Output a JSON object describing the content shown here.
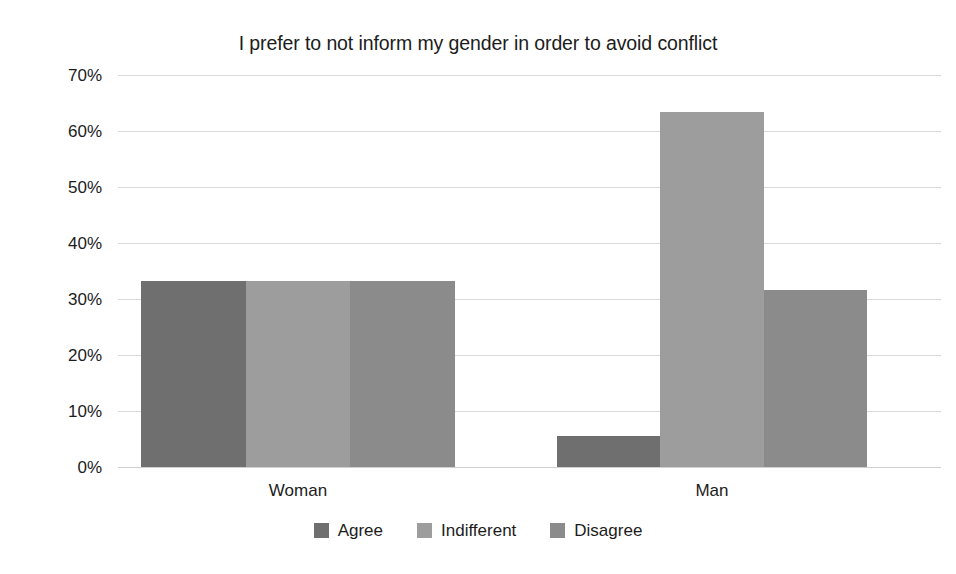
{
  "chart_data": {
    "type": "bar",
    "title": "I prefer to not inform my gender in order to avoid conflict",
    "xlabel": "",
    "ylabel": "",
    "categories": [
      "Woman",
      "Man"
    ],
    "series": [
      {
        "name": "Agree",
        "values": [
          33.3,
          5.5
        ],
        "color": "#6f6f6f"
      },
      {
        "name": "Indifferent",
        "values": [
          33.3,
          63.4
        ],
        "color": "#9d9d9d"
      },
      {
        "name": "Disagree",
        "values": [
          33.3,
          31.6
        ],
        "color": "#8b8b8b"
      }
    ],
    "ylim": [
      0,
      70
    ],
    "ytick_values": [
      70,
      60,
      50,
      40,
      30,
      20,
      10,
      0
    ],
    "ytick_labels": [
      "70%",
      "60%",
      "50%",
      "40%",
      "30%",
      "20%",
      "10%",
      "0%"
    ],
    "grid": true,
    "legend_position": "bottom",
    "bar_gap": "none",
    "value_format": "percent"
  },
  "axis": {
    "y_labels": [
      "70%",
      "60%",
      "50%",
      "40%",
      "30%",
      "20%",
      "10%",
      "0%"
    ],
    "x_labels": [
      "Woman",
      "Man"
    ]
  },
  "legend": {
    "items": [
      {
        "label": "Agree",
        "color": "#6f6f6f"
      },
      {
        "label": "Indifferent",
        "color": "#9d9d9d"
      },
      {
        "label": "Disagree",
        "color": "#8b8b8b"
      }
    ]
  },
  "colors": {
    "background": "#ffffff",
    "text": "#1c1c1c",
    "gridline": "#d9d9d9",
    "agree": "#6f6f6f",
    "indifferent": "#9d9d9d",
    "disagree": "#8b8b8b"
  }
}
